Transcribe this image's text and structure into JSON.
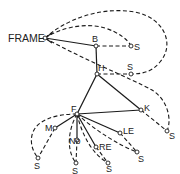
{
  "diagram": {
    "type": "frame-network",
    "nodes": [
      {
        "id": "FRAME",
        "label": "FRAME",
        "x": 45,
        "y": 38
      },
      {
        "id": "B",
        "label": "B",
        "x": 96,
        "y": 46
      },
      {
        "id": "S_B",
        "label": "S",
        "x": 131,
        "y": 46
      },
      {
        "id": "H",
        "label": "H",
        "x": 97,
        "y": 74
      },
      {
        "id": "S_H",
        "label": "S",
        "x": 131,
        "y": 74
      },
      {
        "id": "F",
        "label": "F",
        "x": 77,
        "y": 114
      },
      {
        "id": "K",
        "label": "K",
        "x": 141,
        "y": 110
      },
      {
        "id": "S_K",
        "label": "S",
        "x": 167,
        "y": 131
      },
      {
        "id": "M",
        "label": "M",
        "x": 55,
        "y": 128
      },
      {
        "id": "S_M",
        "label": "S",
        "x": 38,
        "y": 158
      },
      {
        "id": "No",
        "label": "No",
        "x": 77,
        "y": 140
      },
      {
        "id": "S_No",
        "label": "S",
        "x": 76,
        "y": 163
      },
      {
        "id": "RE",
        "label": "RE",
        "x": 96,
        "y": 147
      },
      {
        "id": "S_RE",
        "label": "S",
        "x": 108,
        "y": 163
      },
      {
        "id": "LE",
        "label": "LE",
        "x": 120,
        "y": 133
      },
      {
        "id": "S_LE",
        "label": "S",
        "x": 137,
        "y": 152
      }
    ],
    "solid_edges": [
      [
        "FRAME",
        "B"
      ],
      [
        "B",
        "H"
      ],
      [
        "H",
        "F"
      ],
      [
        "H",
        "K"
      ],
      [
        "F",
        "K"
      ],
      [
        "F",
        "M"
      ],
      [
        "F",
        "No"
      ],
      [
        "F",
        "RE"
      ],
      [
        "F",
        "LE"
      ]
    ],
    "dashed_edges": [
      [
        "FRAME",
        "S_H"
      ],
      [
        "FRAME",
        "S_B"
      ],
      [
        "FRAME",
        "S_K"
      ],
      [
        "B",
        "S_B"
      ],
      [
        "H",
        "S_H"
      ],
      [
        "K",
        "S_K"
      ],
      [
        "F",
        "S_M"
      ],
      [
        "M",
        "S_M"
      ],
      [
        "F",
        "S_No"
      ],
      [
        "No",
        "S_No"
      ],
      [
        "F",
        "S_RE"
      ],
      [
        "RE",
        "S_RE"
      ],
      [
        "F",
        "S_LE"
      ],
      [
        "LE",
        "S_LE"
      ]
    ]
  },
  "labels": {
    "frame": "FRAME",
    "b": "B",
    "s_b": "S",
    "h": "H",
    "s_h": "S",
    "f": "F",
    "k": "K",
    "s_k": "S",
    "m": "M",
    "s_m": "S",
    "no": "No",
    "s_no": "S",
    "re": "RE",
    "s_re": "S",
    "le": "LE",
    "s_le": "S"
  },
  "colors": {
    "line": "#1a1a1a",
    "background": "#ffffff"
  }
}
